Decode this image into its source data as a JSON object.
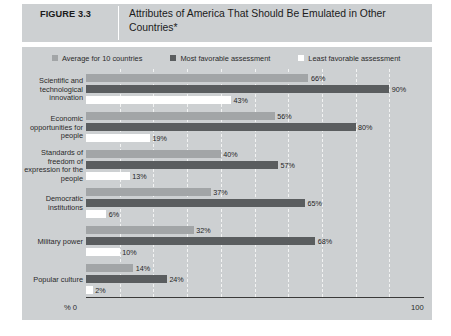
{
  "figure": {
    "number": "FIGURE 3.3",
    "title": "Attributes of America That Should Be Emulated in Other Countries*"
  },
  "axis": {
    "left_label": "% 0",
    "right_label": "100"
  },
  "legend": {
    "entries": [
      {
        "label": "Average for 10 countries",
        "color": "#a2a5a7",
        "key": "avg"
      },
      {
        "label": "Most favorable assessment",
        "color": "#5a5d5f",
        "key": "most"
      },
      {
        "label": "Least favorable assessment",
        "color": "#ffffff",
        "key": "least"
      }
    ]
  },
  "chart_data": {
    "type": "bar",
    "orientation": "horizontal",
    "title": "Attributes of America That Should Be Emulated in Other Countries*",
    "xlabel": "%",
    "ylabel": "",
    "xlim": [
      0,
      100
    ],
    "grid": true,
    "gridline_interval": 10,
    "legend_position": "top",
    "categories": [
      "Scientific and technological innovation",
      "Economic opportunities for people",
      "Standards of freedom of expression for the people",
      "Democratic institutions",
      "Military power",
      "Popular culture"
    ],
    "series": [
      {
        "name": "Average for 10 countries",
        "values": [
          66,
          56,
          40,
          37,
          32,
          14
        ],
        "labels": [
          "66%",
          "56%",
          "40%",
          "37%",
          "32%",
          "14%"
        ]
      },
      {
        "name": "Most favorable assessment",
        "values": [
          90,
          80,
          57,
          65,
          68,
          24
        ],
        "labels": [
          "90%",
          "80%",
          "57%",
          "65%",
          "68%",
          "24%"
        ]
      },
      {
        "name": "Least favorable assessment",
        "values": [
          43,
          19,
          13,
          6,
          10,
          2
        ],
        "labels": [
          "43%",
          "19%",
          "13%",
          "6%",
          "10%",
          "2%"
        ]
      }
    ],
    "xticks": [
      0,
      100
    ],
    "xticklabels": [
      "% 0",
      "100"
    ]
  }
}
